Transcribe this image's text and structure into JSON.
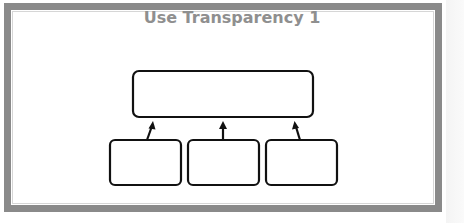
{
  "title": "Use Transparency 1",
  "colors": {
    "frame": "#8a8a8a",
    "title": "#8f8f8f",
    "stroke": "#111111",
    "background": "#ffffff"
  },
  "diagram": {
    "type": "hierarchy",
    "top_box": {
      "label": ""
    },
    "child_boxes": [
      {
        "label": ""
      },
      {
        "label": ""
      },
      {
        "label": ""
      }
    ],
    "arrows": [
      {
        "from": "child_boxes.0",
        "to": "top_box"
      },
      {
        "from": "child_boxes.1",
        "to": "top_box"
      },
      {
        "from": "child_boxes.2",
        "to": "top_box"
      }
    ]
  }
}
